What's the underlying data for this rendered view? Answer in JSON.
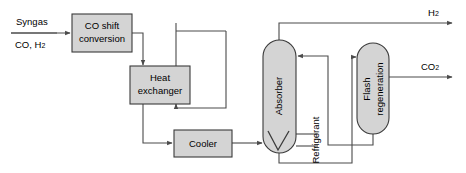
{
  "diagram": {
    "type": "process-flow-diagram",
    "title": "",
    "background_color": "#ffffff",
    "unit_fill_color": "#d4d4d4",
    "unit_border_color": "#3a3a3a",
    "pipe_color": "#4a4a4a"
  },
  "units": [
    {
      "id": "co-shift",
      "label_line1": "CO shift",
      "label_line2": "conversion",
      "shape": "rectangle"
    },
    {
      "id": "heat-exchanger",
      "label_line1": "Heat",
      "label_line2": "exchanger",
      "shape": "rectangle"
    },
    {
      "id": "cooler",
      "label_line1": "Cooler",
      "label_line2": "",
      "shape": "rectangle"
    },
    {
      "id": "absorber",
      "label_line1": "Absorber",
      "label_line2": "",
      "shape": "capsule",
      "orientation": "vertical"
    },
    {
      "id": "flash-regeneration",
      "label_line1": "Flash",
      "label_line2": "regeneration",
      "shape": "capsule",
      "orientation": "vertical"
    }
  ],
  "streams": {
    "feed_top": "Syngas",
    "feed_bottom_text": "CO, H",
    "feed_bottom_sub": "2",
    "hydrogen_text": "H",
    "hydrogen_sub": "2",
    "carbon_dioxide_text": "CO",
    "carbon_dioxide_sub": "2",
    "refrigerant": "Refrigerant"
  }
}
